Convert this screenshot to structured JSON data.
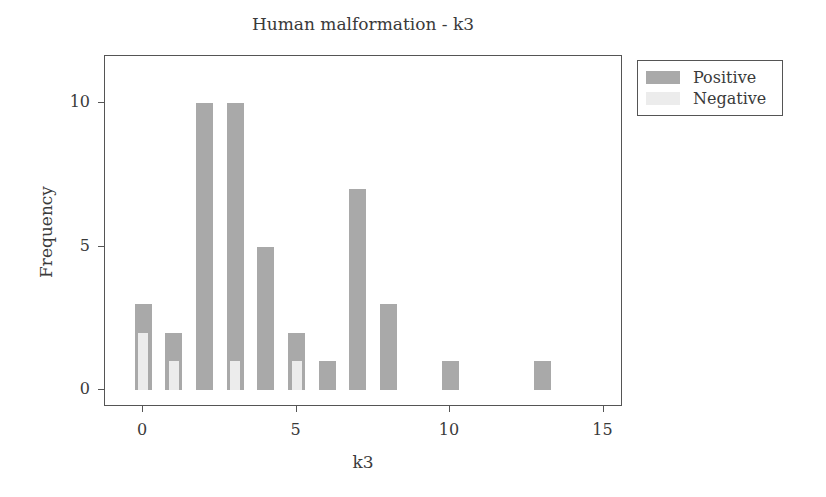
{
  "chart_data": {
    "type": "bar",
    "title": "Human malformation - k3",
    "xlabel": "k3",
    "ylabel": "Frequency",
    "x": [
      0,
      1,
      2,
      3,
      4,
      5,
      6,
      7,
      8,
      10,
      13
    ],
    "series": [
      {
        "name": "Positive",
        "color": "#a9a9a9",
        "values": [
          3,
          2,
          10,
          10,
          5,
          2,
          1,
          7,
          3,
          1,
          1
        ]
      },
      {
        "name": "Negative",
        "color": "#ececec",
        "values": [
          2,
          1,
          0,
          1,
          0,
          1,
          0,
          0,
          0,
          0,
          0
        ]
      }
    ],
    "xlim": [
      -1.2,
      15.6
    ],
    "ylim": [
      -0.6,
      11.6
    ],
    "xticks": [
      0,
      5,
      10,
      15
    ],
    "yticks": [
      0,
      5,
      10
    ],
    "grid": false,
    "legend_position": "right-top",
    "overlaid": true
  },
  "labels": {
    "title": "Human malformation - k3",
    "xlabel": "k3",
    "ylabel": "Frequency",
    "xticks": [
      "0",
      "5",
      "10",
      "15"
    ],
    "yticks": [
      "0",
      "5",
      "10"
    ],
    "legend": [
      "Positive",
      "Negative"
    ]
  }
}
